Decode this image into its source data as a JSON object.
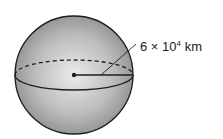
{
  "diagram": {
    "type": "sphere",
    "radius_label": {
      "coefficient": "6",
      "times": "×",
      "base": "10",
      "exponent": "4",
      "unit": "km"
    },
    "colors": {
      "sphere_light": "#e6e6e6",
      "sphere_dark": "#8f8f8f",
      "stroke": "#1e1e1e"
    }
  }
}
